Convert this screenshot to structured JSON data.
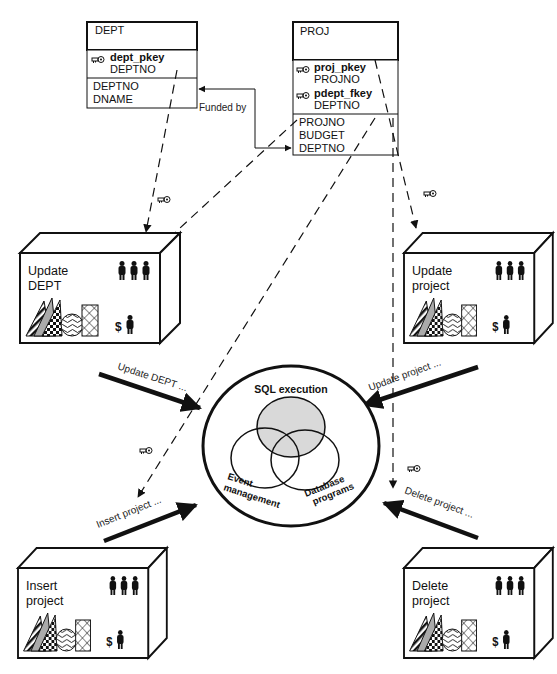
{
  "tables": {
    "dept": {
      "title": "DEPT",
      "keys": [
        {
          "name": "dept_pkey",
          "column": "DEPTNO",
          "icon": "key-icon"
        }
      ],
      "columns": [
        "DEPTNO",
        "DNAME"
      ]
    },
    "proj": {
      "title": "PROJ",
      "keys": [
        {
          "name": "proj_pkey",
          "column": "PROJNO",
          "icon": "key-icon"
        },
        {
          "name": "pdept_fkey",
          "column": "DEPTNO",
          "icon": "key-icon"
        }
      ],
      "columns": [
        "PROJNO",
        "BUDGET",
        "DEPTNO"
      ]
    }
  },
  "relationship": {
    "label": "Funded by"
  },
  "applications": [
    {
      "id": "update-dept",
      "line1": "Update",
      "line2": "DEPT"
    },
    {
      "id": "update-project",
      "line1": "Update",
      "line2": "project"
    },
    {
      "id": "insert-project",
      "line1": "Insert",
      "line2": "project"
    },
    {
      "id": "delete-project",
      "line1": "Delete",
      "line2": "project"
    }
  ],
  "app_icons": {
    "people": "three-people-icon",
    "money": "dollar-person-icon",
    "shapes": "pattern-shapes-icon"
  },
  "requests": [
    {
      "id": "update-dept",
      "label": "Update  DEPT ..."
    },
    {
      "id": "update-project",
      "label": "Update project ..."
    },
    {
      "id": "insert-project",
      "label": "Insert project ..."
    },
    {
      "id": "delete-project",
      "label": "Delete project ..."
    }
  ],
  "engine": {
    "title": "SQL execution",
    "circles": [
      {
        "line1": "Event",
        "line2": "management"
      },
      {
        "line1": "Database",
        "line2": "programs"
      }
    ],
    "highlight_color": "#d9d9d9"
  }
}
